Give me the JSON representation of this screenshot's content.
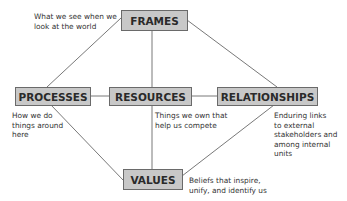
{
  "diagram": {
    "type": "concept-map",
    "nodes": {
      "frames": {
        "label": "FRAMES",
        "note": [
          "What we see when we",
          "look at the world"
        ]
      },
      "processes": {
        "label": "PROCESSES",
        "note": [
          "How we do",
          "things around",
          "here"
        ]
      },
      "resources": {
        "label": "RESOURCES",
        "note": [
          "Things we own that",
          "help us compete"
        ]
      },
      "relationships": {
        "label": "RELATIONSHIPS",
        "note": [
          "Enduring links",
          "to external",
          "stakeholders and",
          "among internal",
          "units"
        ]
      },
      "values": {
        "label": "VALUES",
        "note": [
          "Beliefs that inspire,",
          "unify, and identify us"
        ]
      }
    },
    "edges": [
      [
        "frames",
        "processes"
      ],
      [
        "frames",
        "resources"
      ],
      [
        "frames",
        "relationships"
      ],
      [
        "processes",
        "resources"
      ],
      [
        "resources",
        "relationships"
      ],
      [
        "processes",
        "values"
      ],
      [
        "resources",
        "values"
      ],
      [
        "relationships",
        "values"
      ]
    ],
    "colors": {
      "box_fill": "#c8c8c8",
      "box_border": "#6a6a6a",
      "line": "#555555"
    }
  }
}
